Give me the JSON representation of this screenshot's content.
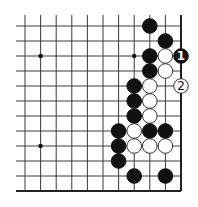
{
  "diagram": {
    "type": "go-board-fragment",
    "corner": "bottom-right",
    "columns": 11,
    "rows": 12,
    "colors": {
      "black": "#111111",
      "white": "#ffffff",
      "line": "#3a3a3a",
      "background": "#ffffff"
    },
    "hoshi": [
      {
        "col": 1,
        "row": 2
      },
      {
        "col": 7,
        "row": 2
      },
      {
        "col": 1,
        "row": 8
      }
    ],
    "stones": [
      {
        "col": 8,
        "row": 0,
        "color": "black"
      },
      {
        "col": 9,
        "row": 1,
        "color": "black"
      },
      {
        "col": 8,
        "row": 2,
        "color": "black"
      },
      {
        "col": 9,
        "row": 2,
        "color": "white"
      },
      {
        "col": 10,
        "row": 2,
        "color": "black",
        "label": "1"
      },
      {
        "col": 8,
        "row": 3,
        "color": "black"
      },
      {
        "col": 9,
        "row": 3,
        "color": "white"
      },
      {
        "col": 7,
        "row": 4,
        "color": "black"
      },
      {
        "col": 8,
        "row": 4,
        "color": "white"
      },
      {
        "col": 10,
        "row": 4,
        "color": "white",
        "label": "2"
      },
      {
        "col": 7,
        "row": 5,
        "color": "black"
      },
      {
        "col": 8,
        "row": 5,
        "color": "white"
      },
      {
        "col": 7,
        "row": 6,
        "color": "black"
      },
      {
        "col": 8,
        "row": 6,
        "color": "white"
      },
      {
        "col": 6,
        "row": 7,
        "color": "black"
      },
      {
        "col": 7,
        "row": 7,
        "color": "white"
      },
      {
        "col": 8,
        "row": 7,
        "color": "black"
      },
      {
        "col": 9,
        "row": 7,
        "color": "black"
      },
      {
        "col": 6,
        "row": 8,
        "color": "black"
      },
      {
        "col": 7,
        "row": 8,
        "color": "white"
      },
      {
        "col": 8,
        "row": 8,
        "color": "white"
      },
      {
        "col": 9,
        "row": 8,
        "color": "white"
      },
      {
        "col": 6,
        "row": 9,
        "color": "black"
      },
      {
        "col": 7,
        "row": 10,
        "color": "black"
      },
      {
        "col": 9,
        "row": 10,
        "color": "black"
      }
    ],
    "move_labels": [
      "1",
      "2"
    ]
  }
}
